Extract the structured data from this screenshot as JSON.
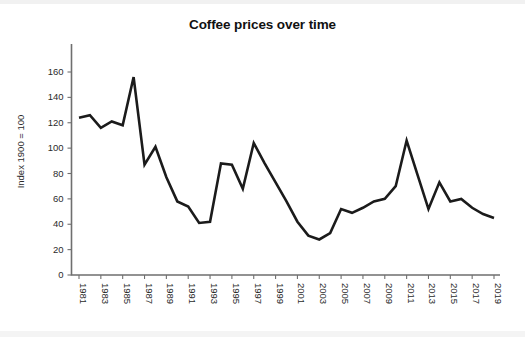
{
  "chart_data": {
    "type": "line",
    "title": "Coffee prices over time",
    "xlabel": "",
    "ylabel": "Index 1900 = 100",
    "xlim": [
      1981,
      2019
    ],
    "ylim": [
      0,
      175
    ],
    "grid": false,
    "legend": false,
    "yticks": [
      0,
      20,
      40,
      60,
      80,
      100,
      120,
      140,
      160
    ],
    "ytick_labels": [
      "0",
      "20",
      "40",
      "60",
      "80",
      "100",
      "120",
      "140",
      "160"
    ],
    "xticks": [
      1981,
      1983,
      1985,
      1987,
      1989,
      1991,
      1993,
      1995,
      1997,
      1999,
      2001,
      2003,
      2005,
      2007,
      2009,
      2011,
      2013,
      2015,
      2017,
      2019
    ],
    "xtick_labels": [
      "1981",
      "1983",
      "1985",
      "1987",
      "1989",
      "1991",
      "1993",
      "1995",
      "1997",
      "1999",
      "2001",
      "2003",
      "2005",
      "2007",
      "2009",
      "2011",
      "2013",
      "2015",
      "2017",
      "2019"
    ],
    "x": [
      1981,
      1982,
      1983,
      1984,
      1985,
      1986,
      1987,
      1988,
      1989,
      1990,
      1991,
      1992,
      1993,
      1994,
      1995,
      1996,
      1997,
      1998,
      1999,
      2000,
      2001,
      2002,
      2003,
      2004,
      2005,
      2006,
      2007,
      2008,
      2009,
      2010,
      2011,
      2012,
      2013,
      2014,
      2015,
      2016,
      2017,
      2018,
      2019
    ],
    "series": [
      {
        "name": "Coffee price index",
        "color": "#1b1b1b",
        "values": [
          124,
          126,
          116,
          121,
          118,
          156,
          87,
          101,
          77,
          58,
          54,
          41,
          42,
          88,
          87,
          68,
          104,
          88,
          73,
          58,
          42,
          31,
          28,
          33,
          52,
          49,
          53,
          58,
          60,
          70,
          106,
          79,
          52,
          73,
          58,
          60,
          53,
          48,
          45
        ]
      }
    ]
  }
}
